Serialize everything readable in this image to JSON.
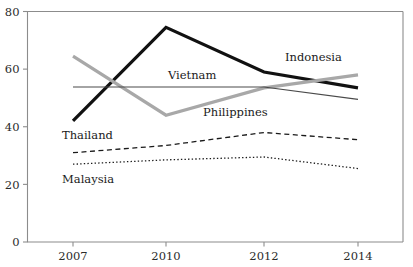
{
  "chart_data": {
    "type": "line",
    "title": "",
    "subtitle": "",
    "xlabel": "",
    "ylabel": "",
    "x": [
      2007,
      2010,
      2012,
      2014
    ],
    "categories": [
      "2007",
      "2010",
      "2012",
      "2014"
    ],
    "xtick_labels": [
      "2007",
      "2010",
      "2012",
      "2014"
    ],
    "ytick_labels": [
      "0",
      "20",
      "40",
      "60",
      "80"
    ],
    "yticks": [
      0,
      20,
      40,
      60,
      80
    ],
    "ylim": [
      0,
      80
    ],
    "xlim": [
      2006.3,
      2014.9
    ],
    "grid": false,
    "legend": "inline-labels",
    "series": [
      {
        "name": "Indonesia",
        "values": [
          42,
          74.5,
          59,
          53.5
        ],
        "style": "solid-thick-black",
        "color": "#111111",
        "width": 3.2,
        "dash": "none",
        "label": "Indonesia",
        "label_x": 285,
        "label_y": 61
      },
      {
        "name": "Philippines",
        "values": [
          64.5,
          44,
          53.5,
          58
        ],
        "style": "solid-thick-grey",
        "color": "#a8a8a8",
        "width": 3.2,
        "dash": "none",
        "label": "Philippines",
        "label_x": 203,
        "label_y": 116
      },
      {
        "name": "Vietnam",
        "values": [
          53.8,
          53.8,
          53.8,
          49.5
        ],
        "style": "solid-thin-black",
        "color": "#4a4a4a",
        "width": 1.2,
        "dash": "none",
        "label": "Vietnam",
        "label_x": 168,
        "label_y": 79
      },
      {
        "name": "Thailand",
        "values": [
          31,
          33.5,
          38,
          35.5
        ],
        "style": "dashed-black",
        "color": "#1a1a1a",
        "width": 1.3,
        "dash": "5,3.5",
        "label": "Thailand",
        "label_x": 62,
        "label_y": 139
      },
      {
        "name": "Malaysia",
        "values": [
          27,
          28.5,
          29.5,
          25.5
        ],
        "style": "dotted-black",
        "color": "#1a1a1a",
        "width": 1.3,
        "dash": "1.4,2.2",
        "label": "Malaysia",
        "label_x": 62,
        "label_y": 183
      }
    ],
    "colors": {
      "axis": "#8c8c8c",
      "text": "#2b2b2b",
      "indonesia": "#111111",
      "philippines": "#a8a8a8",
      "vietnam": "#4a4a4a",
      "thailand": "#1a1a1a",
      "malaysia": "#1a1a1a",
      "background": "#ffffff"
    }
  }
}
